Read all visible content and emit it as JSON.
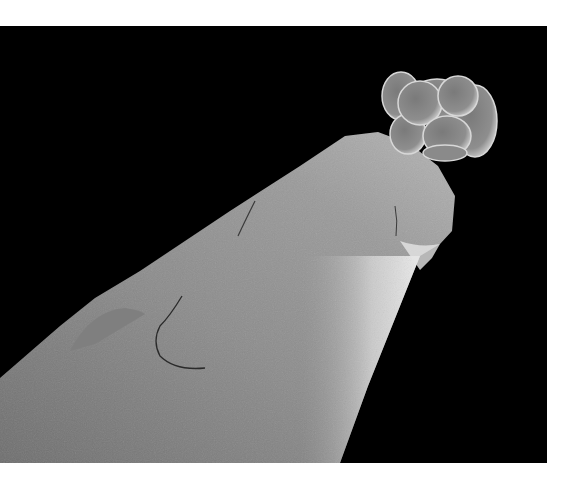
{
  "image": {
    "description": "Scanning electron micrograph of a cluster of spherical cells (embryo) resting on the tip of a needle",
    "background_color": "#000000",
    "margin_color": "#ffffff",
    "subjects": [
      {
        "name": "needle-tip",
        "tone": "gray"
      },
      {
        "name": "cell-cluster",
        "cells": 8,
        "tone": "gray"
      }
    ]
  }
}
